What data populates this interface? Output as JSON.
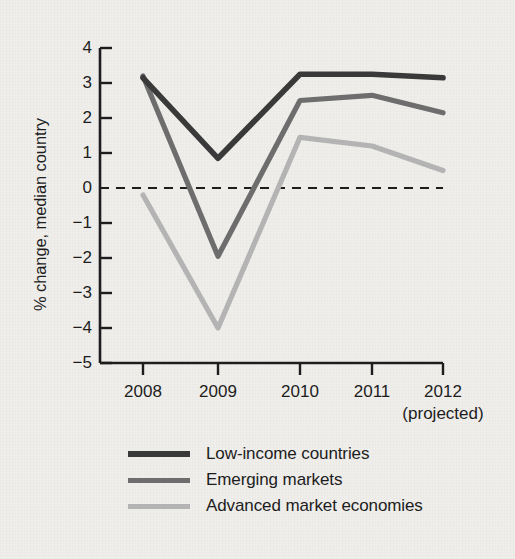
{
  "chart_data": {
    "type": "line",
    "title": "",
    "xlabel": "",
    "ylabel": "% change, median country",
    "x": [
      "2008",
      "2009",
      "2010",
      "2011",
      "2012"
    ],
    "categories": [
      "2008",
      "2009",
      "2010",
      "2011",
      "2012"
    ],
    "xtick_labels": [
      "2008",
      "2009",
      "2010",
      "2011",
      "2012"
    ],
    "ytick_labels": [
      "4",
      "3",
      "2",
      "1",
      "0",
      "−1",
      "−2",
      "−3",
      "−4",
      "−5"
    ],
    "ytick_values": [
      4,
      3,
      2,
      1,
      0,
      -1,
      -2,
      -3,
      -4,
      -5
    ],
    "ylim": [
      -5,
      4
    ],
    "xlim": [
      "2008",
      "2012"
    ],
    "grid": false,
    "zero_line": true,
    "zero_line_style": "dashed",
    "legend_position": "bottom-left",
    "annotations": [
      "(projected)"
    ],
    "series": [
      {
        "name": "Low-income countries",
        "color": "#3a3a3a",
        "values": [
          3.15,
          0.85,
          3.25,
          3.25,
          3.15
        ]
      },
      {
        "name": "Emerging markets",
        "color": "#6e6e6e",
        "values": [
          3.2,
          -1.95,
          2.5,
          2.65,
          2.15
        ]
      },
      {
        "name": "Advanced market economies",
        "color": "#b5b5b5",
        "values": [
          -0.2,
          -4.0,
          1.45,
          1.2,
          0.5
        ]
      }
    ]
  },
  "axis": {
    "y_label": "% change, median country",
    "projected_note": "(projected)"
  },
  "legend": {
    "items": [
      {
        "label": "Low-income countries",
        "color": "#3a3a3a"
      },
      {
        "label": "Emerging markets",
        "color": "#6e6e6e"
      },
      {
        "label": "Advanced market economies",
        "color": "#b5b5b5"
      }
    ]
  },
  "colors": {
    "background": "#efeeeb",
    "axis": "#1d1d1d",
    "text": "#1d1d1d",
    "series_dark": "#3a3a3a",
    "series_medium": "#6e6e6e",
    "series_light": "#b5b5b5"
  }
}
